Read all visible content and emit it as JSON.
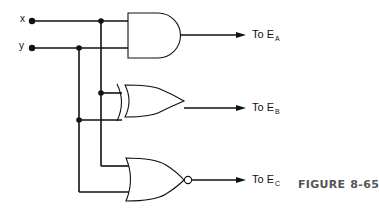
{
  "diagram": {
    "type": "logic-circuit",
    "inputs": [
      {
        "id": "x",
        "label": "x"
      },
      {
        "id": "y",
        "label": "y"
      }
    ],
    "gates": [
      {
        "id": "and",
        "type": "AND",
        "inputs": [
          "x",
          "y"
        ],
        "output": "E_A"
      },
      {
        "id": "xor",
        "type": "XOR",
        "inputs": [
          "x",
          "y"
        ],
        "output": "E_B"
      },
      {
        "id": "nor",
        "type": "NOR",
        "inputs": [
          "x",
          "y"
        ],
        "output": "E_C"
      }
    ],
    "outputs": [
      {
        "prefix": "To E",
        "sub": "A"
      },
      {
        "prefix": "To E",
        "sub": "B"
      },
      {
        "prefix": "To E",
        "sub": "C"
      }
    ],
    "caption": {
      "word": "FIGURE",
      "number": "8-65"
    },
    "colors": {
      "line": "#111111",
      "caption": "#555555",
      "background": "#ffffff"
    }
  }
}
